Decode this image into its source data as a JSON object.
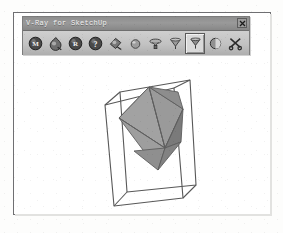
{
  "figure": {
    "frame_border_color": "#6f6f72",
    "background_color": "#ffffff"
  },
  "window": {
    "title": "V-Ray for SketchUp",
    "titlebar_color": "#8e8e8e",
    "body_color": "#b8b8b8",
    "close_button_label": "x",
    "close_icon": "close-icon"
  },
  "toolbar": {
    "buttons": [
      {
        "name": "material-editor-button",
        "icon": "sphere-m-icon",
        "glyph": "M",
        "selected": false
      },
      {
        "name": "material-layers-button",
        "icon": "material-droplet-icon",
        "glyph": "",
        "selected": false
      },
      {
        "name": "render-options-button",
        "icon": "sphere-r-icon",
        "glyph": "R",
        "selected": false
      },
      {
        "name": "help-button",
        "icon": "sphere-question-icon",
        "glyph": "?",
        "selected": false
      },
      {
        "name": "apply-material-button",
        "icon": "material-tag-icon",
        "glyph": "",
        "selected": false
      },
      {
        "name": "sphere-light-button",
        "icon": "sphere-light-icon",
        "glyph": "",
        "selected": false
      },
      {
        "name": "omni-light-button",
        "icon": "omni-light-icon",
        "glyph": "",
        "selected": false
      },
      {
        "name": "spot-light-button",
        "icon": "spot-light-icon",
        "glyph": "",
        "selected": false
      },
      {
        "name": "rectangle-light-button",
        "icon": "rectangle-light-icon",
        "glyph": "",
        "selected": true
      },
      {
        "name": "render-button",
        "icon": "render-sphere-icon",
        "glyph": "",
        "selected": false
      },
      {
        "name": "render-region-button",
        "icon": "scissors-icon",
        "glyph": "",
        "selected": false
      }
    ]
  },
  "scene": {
    "description": "Octahedron inside a wireframe bounding box",
    "wire_color": "#555555",
    "face_light": "#a8a8a8",
    "face_mid": "#909090",
    "face_dark": "#777777",
    "face_bottom": "#8a8a8a",
    "box_vertices": {
      "front_top_left": "103,105",
      "front_top_right": "172,88",
      "front_bottom_right": "181,198",
      "front_bottom_left": "112,206",
      "back_top_left": "118,92",
      "back_top_right": "188,80",
      "back_bottom_right": "194,185",
      "back_bottom_left": "125,192"
    },
    "octahedron_vertices": {
      "top": "147,87",
      "bottom": "156,170",
      "left": "117,118",
      "right": "181,110",
      "front": "140,148",
      "back": "172,92"
    }
  }
}
